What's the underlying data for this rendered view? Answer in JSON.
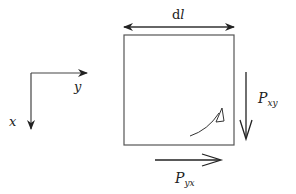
{
  "diagram": {
    "width_label": {
      "main": "d",
      "italic": "l"
    },
    "axes": {
      "x_label": "x",
      "y_label": "y"
    },
    "right_force": {
      "symbol": "P",
      "subscript": "xy"
    },
    "bottom_force": {
      "symbol": "P",
      "subscript": "yx"
    },
    "colors": {
      "stroke": "#2a2a2a",
      "box": "#555555",
      "background": "#ffffff"
    }
  }
}
